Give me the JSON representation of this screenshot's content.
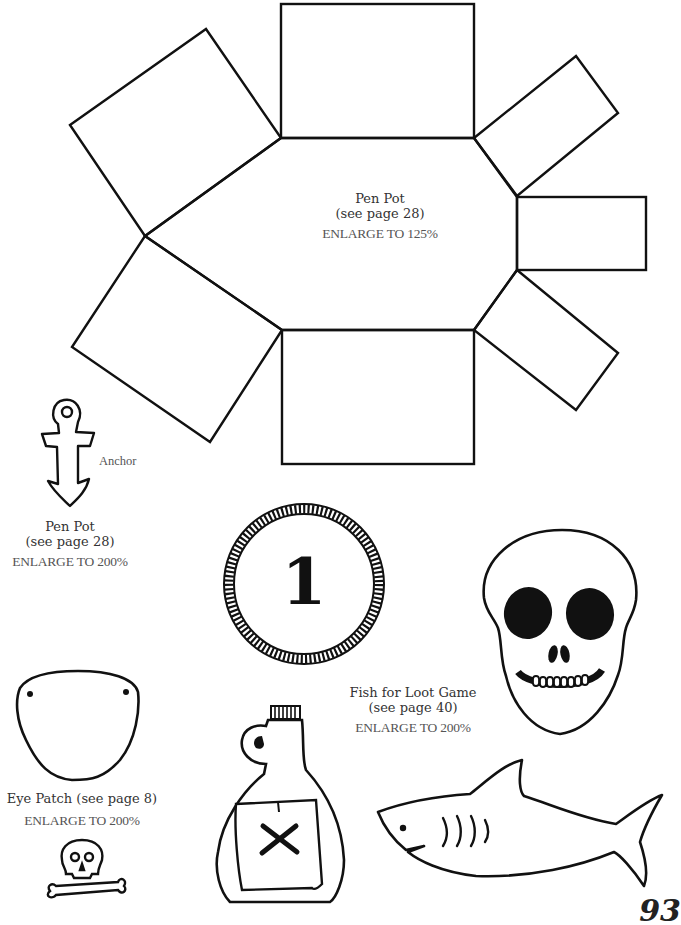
{
  "page": {
    "page_number": "93"
  },
  "pen_pot_large": {
    "title": "Pen Pot",
    "reference": "(see page 28)",
    "instruction": "ENLARGE TO 125%"
  },
  "anchor": {
    "label": "Anchor"
  },
  "pen_pot_small": {
    "title": "Pen Pot",
    "reference": "(see page 28)",
    "instruction": "ENLARGE TO 200%"
  },
  "coin": {
    "number": "1"
  },
  "fish_for_loot": {
    "title": "Fish for Loot Game",
    "reference": "(see page 40)",
    "instruction": "ENLARGE TO 200%"
  },
  "eye_patch": {
    "title": "Eye Patch (see page 8)",
    "instruction": "ENLARGE TO 200%"
  },
  "colors": {
    "ink": "#111111",
    "text": "#333333",
    "instruction_text": "#555555",
    "background": "#ffffff"
  }
}
